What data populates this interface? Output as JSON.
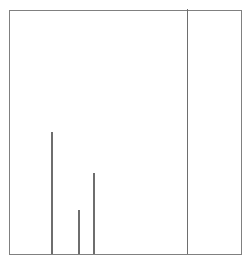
{
  "figure": {
    "width": 252,
    "height": 263,
    "background_color": "#ffffff"
  },
  "frame": {
    "left": 9,
    "top": 10,
    "right": 242,
    "bottom": 255,
    "width": 233,
    "height": 245,
    "border_color": "#808080",
    "border_width": 1,
    "fill_color": "#ffffff"
  },
  "chart_data": {
    "type": "bar",
    "title": "",
    "subtitle": "",
    "xlabel": "",
    "ylabel": "",
    "grid": false,
    "legend": null,
    "axis_ticks_visible": false,
    "tick_labels_visible": false,
    "stem_color": "#6e6e6e",
    "stem_width_px": 1.5,
    "baseline_y_px": 255,
    "xlim": [
      0,
      233
    ],
    "ylim": [
      0,
      245
    ],
    "categories": [
      "s1",
      "s2",
      "s3",
      "s4"
    ],
    "values": [
      122,
      44,
      81,
      245
    ],
    "x_positions_px": [
      41,
      68,
      83,
      176.5
    ],
    "top_y_px": [
      133,
      211,
      174,
      10
    ],
    "height_px": [
      122,
      44,
      81,
      245
    ],
    "normalized_values": [
      0.498,
      0.18,
      0.331,
      1.0
    ]
  }
}
